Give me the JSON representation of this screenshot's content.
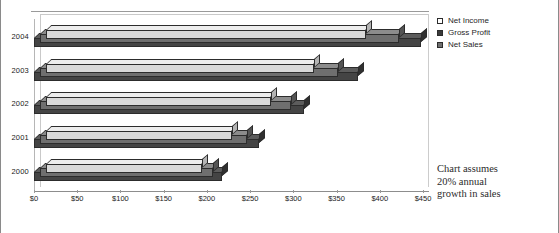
{
  "chart_data": {
    "type": "bar",
    "orientation": "horizontal",
    "style": "3d",
    "title": "",
    "xlabel": "",
    "ylabel": "",
    "categories": [
      "2004",
      "2003",
      "2002",
      "2001",
      "2000"
    ],
    "series": [
      {
        "name": "Net Income",
        "values": [
          370,
          310,
          260,
          215,
          180
        ],
        "color": "#d9d9d9"
      },
      {
        "name": "Gross Profit",
        "values": [
          415,
          345,
          290,
          240,
          200
        ],
        "color": "#6f6f6f"
      },
      {
        "name": "Net Sales",
        "values": [
          448,
          375,
          312,
          260,
          217
        ],
        "color": "#444444"
      }
    ],
    "xlim": [
      0,
      450
    ],
    "xtick_labels": [
      "$0",
      "$50",
      "$100",
      "$150",
      "$200",
      "$250",
      "$300",
      "$350",
      "$400",
      "$450"
    ],
    "xtick_values": [
      0,
      50,
      100,
      150,
      200,
      250,
      300,
      350,
      400,
      450
    ],
    "grid": false,
    "legend_position": "right",
    "annotation": "Chart assumes 20% annual growth in sales"
  },
  "legend": {
    "items": [
      {
        "label": "Net Income",
        "swatch": "legend-swatch-net-income"
      },
      {
        "label": "Gross Profit",
        "swatch": "legend-swatch-gross-profit"
      },
      {
        "label": "Net Sales",
        "swatch": "legend-swatch-net-sales"
      }
    ]
  },
  "annotation": {
    "line1": "Chart assumes",
    "line2": "20% annual",
    "line3": "growth in sales"
  }
}
